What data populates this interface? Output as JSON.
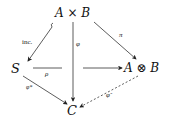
{
  "diagram": {
    "type": "commutative-diagram",
    "nodes": {
      "product": "A × B",
      "S": "S",
      "tensor": "A ⊗ B",
      "C": "C"
    },
    "arrows": {
      "inc": {
        "label": "inc.",
        "from": "A × B",
        "to": "S",
        "style": "hooked"
      },
      "phi": {
        "label": "φ",
        "from": "A × B",
        "to": "C",
        "style": "solid"
      },
      "pi": {
        "label": "π",
        "from": "A × B",
        "to": "A ⊗ B",
        "style": "solid"
      },
      "rho": {
        "label": "ρ",
        "from": "S",
        "to": "A ⊗ B",
        "style": "solid-broken"
      },
      "phi_star": {
        "label": "φ*",
        "from": "S",
        "to": "C",
        "style": "solid"
      },
      "phi_tilde": {
        "label": "φ̃",
        "from": "A ⊗ B",
        "to": "C",
        "style": "dashed"
      }
    }
  }
}
